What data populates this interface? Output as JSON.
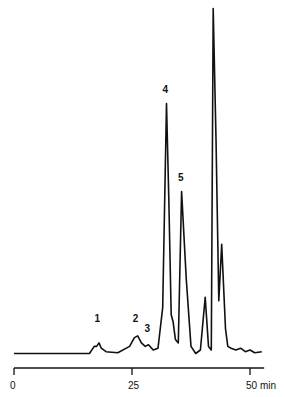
{
  "chart_data": {
    "type": "line",
    "title": "",
    "xlabel": "min",
    "ylabel": "",
    "xlim": [
      0,
      53
    ],
    "ylim": [
      0,
      1.0
    ],
    "x_ticks": [
      0,
      25,
      50
    ],
    "x_tick_labels": [
      "0",
      "25",
      "50 min"
    ],
    "grid": false,
    "legend": "none",
    "series": [
      {
        "name": "chromatogram",
        "points": [
          [
            0,
            0.01
          ],
          [
            16,
            0.01
          ],
          [
            17,
            0.03
          ],
          [
            17.5,
            0.03
          ],
          [
            18,
            0.04
          ],
          [
            18.5,
            0.025
          ],
          [
            19.5,
            0.015
          ],
          [
            22,
            0.012
          ],
          [
            24.5,
            0.03
          ],
          [
            25.5,
            0.055
          ],
          [
            26.2,
            0.06
          ],
          [
            27,
            0.04
          ],
          [
            27.8,
            0.03
          ],
          [
            28.5,
            0.035
          ],
          [
            29.5,
            0.02
          ],
          [
            30.5,
            0.025
          ],
          [
            31.5,
            0.14
          ],
          [
            32.3,
            0.72
          ],
          [
            32.8,
            0.45
          ],
          [
            33.3,
            0.12
          ],
          [
            33.7,
            0.1
          ],
          [
            34.2,
            0.05
          ],
          [
            34.8,
            0.04
          ],
          [
            35.5,
            0.47
          ],
          [
            36.5,
            0.22
          ],
          [
            37.5,
            0.03
          ],
          [
            38.5,
            0.01
          ],
          [
            39.5,
            0.02
          ],
          [
            40.5,
            0.17
          ],
          [
            41.2,
            0.03
          ],
          [
            41.8,
            0.02
          ],
          [
            42.2,
            0.99
          ],
          [
            42.8,
            0.62
          ],
          [
            43.4,
            0.16
          ],
          [
            44.0,
            0.32
          ],
          [
            44.8,
            0.08
          ],
          [
            45.3,
            0.03
          ],
          [
            46,
            0.025
          ],
          [
            47,
            0.02
          ],
          [
            48,
            0.025
          ],
          [
            49,
            0.015
          ],
          [
            50,
            0.02
          ],
          [
            51,
            0.012
          ],
          [
            52.5,
            0.015
          ]
        ]
      }
    ],
    "annotations": [
      {
        "text": "1",
        "x": 17.7,
        "y": 0.1
      },
      {
        "text": "2",
        "x": 25.8,
        "y": 0.1
      },
      {
        "text": "3",
        "x": 28.3,
        "y": 0.07
      },
      {
        "text": "4",
        "x": 32.1,
        "y": 0.75
      },
      {
        "text": "5",
        "x": 35.4,
        "y": 0.5
      }
    ]
  }
}
